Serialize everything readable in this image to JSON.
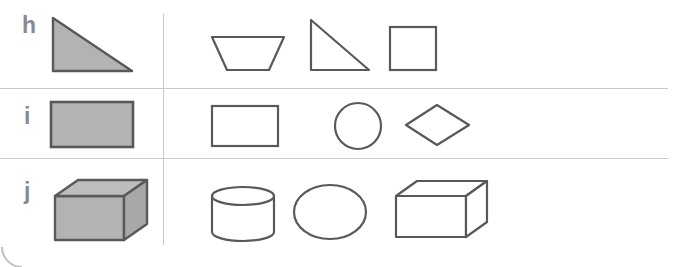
{
  "worksheet": {
    "title": "Geometric shapes matching worksheet",
    "description": "Three lettered rows; each row shows one shaded reference shape at left of a vertical rule and a set of outlined candidate shapes at right.",
    "colors": {
      "page_background": "#ffffff",
      "rule_line": "#c9c9c9",
      "shape_stroke": "#595959",
      "shape_fill_shaded": "#b3b3b3",
      "shape_fill_open": "#ffffff",
      "shape_fill_top_face": "#bdbdbd",
      "shape_fill_side_face": "#a8a8a8",
      "label_text": "#8a8a8a"
    },
    "rules": {
      "vertical_divider": {
        "x": 163,
        "y_top": 14,
        "y_bottom": 245
      },
      "horizontal_dividers": [
        {
          "y": 88,
          "x_start": 0,
          "x_end": 668
        },
        {
          "y": 158,
          "x_start": 0,
          "x_end": 668
        }
      ]
    },
    "rows": [
      {
        "label": "h",
        "label_pos": {
          "x": 22,
          "y": 14
        },
        "prompt_shape": {
          "name": "right-triangle-shaded",
          "label": "shaded right triangle",
          "filled": true
        },
        "option_shapes": [
          {
            "name": "trapezoid-outline",
            "label": "trapezoid",
            "filled": false
          },
          {
            "name": "right-triangle-outline",
            "label": "right triangle",
            "filled": false
          },
          {
            "name": "square-outline",
            "label": "square",
            "filled": false
          }
        ]
      },
      {
        "label": "i",
        "label_pos": {
          "x": 24,
          "y": 105
        },
        "prompt_shape": {
          "name": "rectangle-shaded",
          "label": "shaded rectangle",
          "filled": true
        },
        "option_shapes": [
          {
            "name": "rectangle-outline",
            "label": "rectangle",
            "filled": false
          },
          {
            "name": "circle-outline",
            "label": "circle",
            "filled": false
          },
          {
            "name": "rhombus-outline",
            "label": "rhombus",
            "filled": false
          }
        ]
      },
      {
        "label": "j",
        "label_pos": {
          "x": 24,
          "y": 180
        },
        "prompt_shape": {
          "name": "cuboid-shaded",
          "label": "shaded cuboid",
          "filled": true
        },
        "option_shapes": [
          {
            "name": "cylinder-outline",
            "label": "cylinder",
            "filled": false
          },
          {
            "name": "ellipse-outline",
            "label": "ellipse",
            "filled": false
          },
          {
            "name": "cuboid-outline",
            "label": "cuboid",
            "filled": false
          }
        ]
      }
    ],
    "corner_mark": {
      "name": "page-corner-arc",
      "label": "partial circular arc at bottom-left page edge"
    }
  }
}
